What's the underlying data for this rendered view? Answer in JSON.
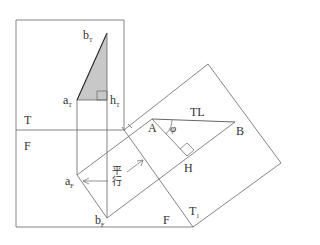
{
  "diagram": {
    "planes": {
      "top": "T",
      "front": "F",
      "auxiliary": "T",
      "auxiliary_sub": "1"
    },
    "points": {
      "bT": {
        "main": "b",
        "sub": "T"
      },
      "aT": {
        "main": "a",
        "sub": "T"
      },
      "hT": {
        "main": "h",
        "sub": "T"
      },
      "aF": {
        "main": "a",
        "sub": "F"
      },
      "bF": {
        "main": "b",
        "sub": "F"
      },
      "A": "A",
      "B": "B",
      "H": "H"
    },
    "true_length_label": "TL",
    "angle_label": "φ",
    "parallel_label_line1": "平",
    "parallel_label_line2": "行",
    "colors": {
      "line": "#555555",
      "shade": "#c8c8c8",
      "text": "#333333"
    }
  }
}
